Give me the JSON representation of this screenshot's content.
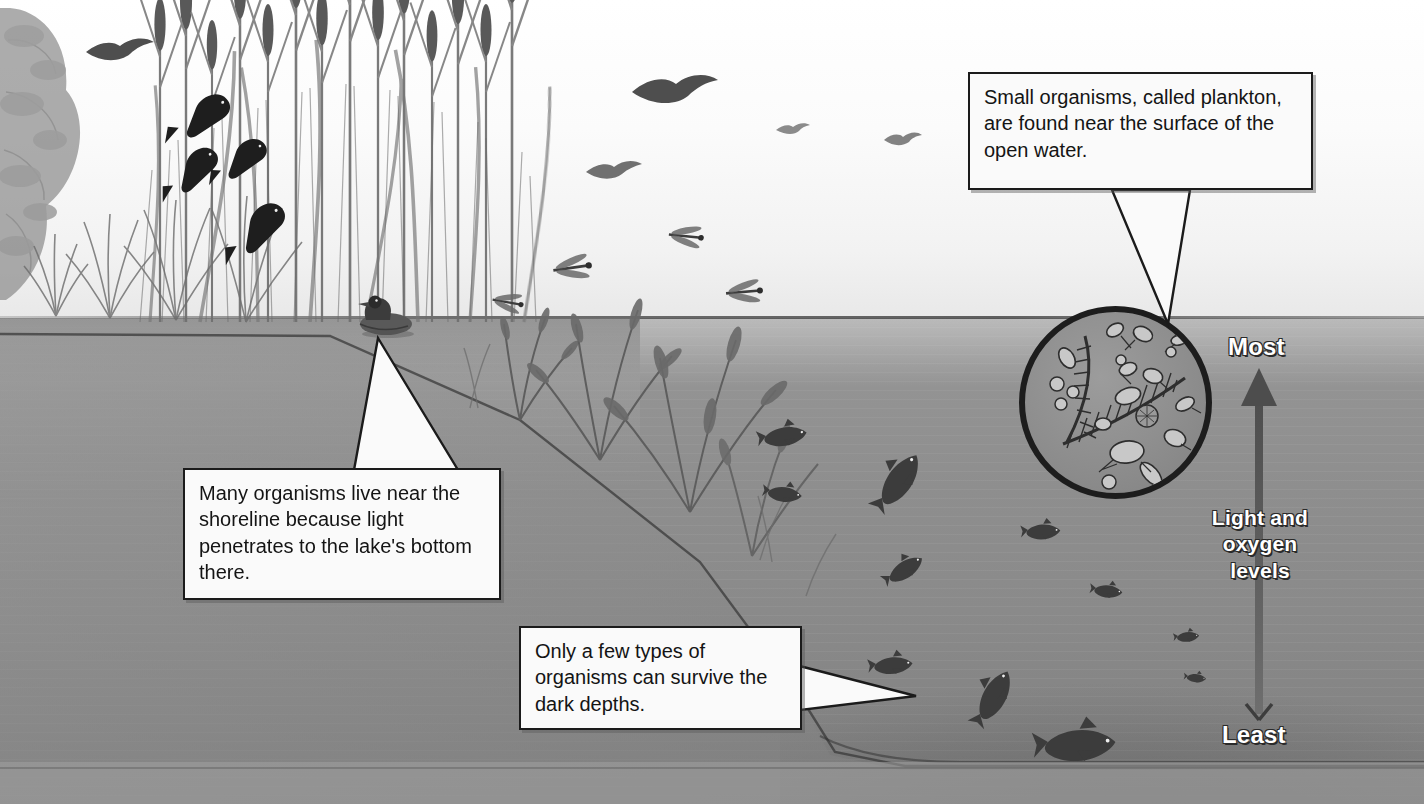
{
  "figure": {
    "style": "grayscale pencil illustration"
  },
  "callouts": [
    {
      "id": "plankton",
      "text": "Small organisms, called plankton, are found near the surface of the open water.",
      "points_to": "plankton-inset"
    },
    {
      "id": "shoreline",
      "text": "Many organisms live near the shoreline because light penetrates to the lake's bottom there.",
      "points_to": "shoreline-duck"
    },
    {
      "id": "depths",
      "text": "Only a few types of organisms can survive the dark depths.",
      "points_to": "deep-water"
    }
  ],
  "gradient_scale": {
    "top_label": "Most",
    "bottom_label": "Least",
    "axis_label": "Light and oxygen levels",
    "axis_label_line1": "Light and",
    "axis_label_line2": "oxygen",
    "axis_label_line3": "levels",
    "direction": "up",
    "arrow_color": "#5d5d5d"
  },
  "scene": {
    "sky_color": "#f7f7f7",
    "water_color": "#8e8e8e",
    "surface_line_y": 318,
    "ink_color": "#1b1b1b",
    "box_fill": "#fafafa",
    "regions": [
      {
        "name": "shoreline-vegetation",
        "description": "cattails, reeds and a tree along the left bank"
      },
      {
        "name": "open-water",
        "description": "deep open water on the right"
      },
      {
        "name": "lake-bottom",
        "description": "dark sloping lake bed"
      }
    ],
    "organisms": [
      {
        "name": "blackbirds",
        "count": 4,
        "zone": "cattails"
      },
      {
        "name": "flying-bird",
        "count": 2,
        "zone": "sky"
      },
      {
        "name": "swallow",
        "count": 1,
        "zone": "sky"
      },
      {
        "name": "dragonflies",
        "count": 4,
        "zone": "above-water"
      },
      {
        "name": "duck",
        "count": 1,
        "zone": "shoreline"
      },
      {
        "name": "aquatic-plants",
        "count": 6,
        "zone": "shallow-water"
      },
      {
        "name": "fish",
        "count": 11,
        "zone": "open-water"
      },
      {
        "name": "plankton",
        "count": 20,
        "zone": "surface-inset"
      }
    ]
  }
}
